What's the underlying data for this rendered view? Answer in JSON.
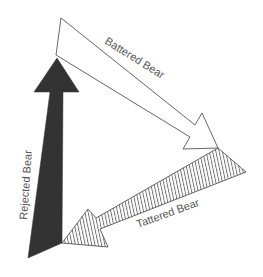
{
  "diagram": {
    "arrows": [
      {
        "id": "battered",
        "label": "Battered Bear",
        "style": "outline",
        "fill": "#ffffff",
        "stroke": "#555555"
      },
      {
        "id": "tattered",
        "label": "Tattered Bear",
        "style": "hatched",
        "fill": "#ffffff",
        "stroke": "#555555"
      },
      {
        "id": "rejected",
        "label": "Rejected Bear",
        "style": "solid",
        "fill": "#333333",
        "stroke": "#333333"
      }
    ]
  }
}
